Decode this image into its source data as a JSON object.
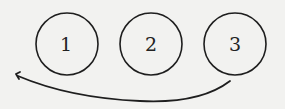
{
  "diagram": {
    "type": "hand-drawn sequence diagram",
    "background_color": "#f2f2f0",
    "stroke_color": "#1e1e1e",
    "nodes": [
      {
        "id": "node-1",
        "label": "1",
        "cx": 67,
        "cy": 44,
        "r": 31
      },
      {
        "id": "node-2",
        "label": "2",
        "cx": 151,
        "cy": 44,
        "r": 31
      },
      {
        "id": "node-3",
        "label": "3",
        "cx": 235,
        "cy": 44,
        "r": 31
      }
    ],
    "edges": [
      {
        "from": "node-3",
        "to": "before-node-1",
        "shape": "curved arrow looping back left",
        "arrowhead": "left end"
      }
    ]
  }
}
